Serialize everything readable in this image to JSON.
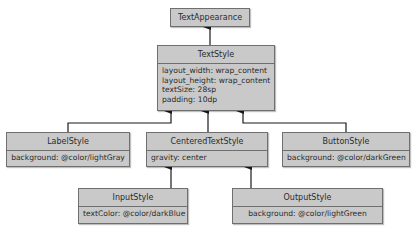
{
  "diagram": {
    "type": "class-hierarchy",
    "nodes": [
      {
        "id": "TextAppearance",
        "title": "TextAppearance",
        "attributes": []
      },
      {
        "id": "TextStyle",
        "title": "TextStyle",
        "attributes": [
          "layout_width: wrap_content",
          "layout_height: wrap_content",
          "textSize: 28sp",
          "padding: 10dp"
        ]
      },
      {
        "id": "LabelStyle",
        "title": "LabelStyle",
        "attributes": [
          "background: @color/lightGray"
        ]
      },
      {
        "id": "CenteredTextStyle",
        "title": "CenteredTextStyle",
        "attributes": [
          "gravity: center"
        ]
      },
      {
        "id": "ButtonStyle",
        "title": "ButtonStyle",
        "attributes": [
          "background: @color/darkGreen"
        ]
      },
      {
        "id": "InputStyle",
        "title": "InputStyle",
        "attributes": [
          "textColor: @color/darkBlue"
        ]
      },
      {
        "id": "OutputStyle",
        "title": "OutputStyle",
        "attributes": [
          "background: @color/lightGreen"
        ]
      }
    ],
    "edges": [
      {
        "from": "TextStyle",
        "to": "TextAppearance"
      },
      {
        "from": "LabelStyle",
        "to": "TextStyle"
      },
      {
        "from": "CenteredTextStyle",
        "to": "TextStyle"
      },
      {
        "from": "ButtonStyle",
        "to": "TextStyle"
      },
      {
        "from": "InputStyle",
        "to": "CenteredTextStyle"
      },
      {
        "from": "OutputStyle",
        "to": "CenteredTextStyle"
      }
    ],
    "colors": {
      "box_fill": "#c9c9c9",
      "box_border": "#6f6f6f",
      "arrow": "#1a1a1a"
    }
  }
}
